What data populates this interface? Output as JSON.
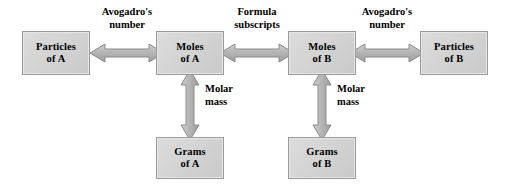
{
  "diagram": {
    "background_color": "#ffffff",
    "box_fill_color": "#d4d4d4",
    "box_border_color": "#9a9a9a",
    "arrow_fill_color": "#b4b4b4",
    "arrow_border_color": "#8a8a8a",
    "text_color": "#000000"
  },
  "nodes": {
    "particles_a": {
      "line1": "Particles",
      "line2": "of A"
    },
    "moles_a": {
      "line1": "Moles",
      "line2": "of A"
    },
    "moles_b": {
      "line1": "Moles",
      "line2": "of B"
    },
    "particles_b": {
      "line1": "Particles",
      "line2": "of B"
    },
    "grams_a": {
      "line1": "Grams",
      "line2": "of A"
    },
    "grams_b": {
      "line1": "Grams",
      "line2": "of B"
    }
  },
  "edge_labels": {
    "avogadro_left": {
      "line1": "Avogadro's",
      "line2": "number"
    },
    "formula": {
      "line1": "Formula",
      "line2": "subscripts"
    },
    "avogadro_right": {
      "line1": "Avogadro's",
      "line2": "number"
    },
    "molar_mass_a": {
      "line1": "Molar",
      "line2": "mass"
    },
    "molar_mass_b": {
      "line1": "Molar",
      "line2": "mass"
    }
  }
}
